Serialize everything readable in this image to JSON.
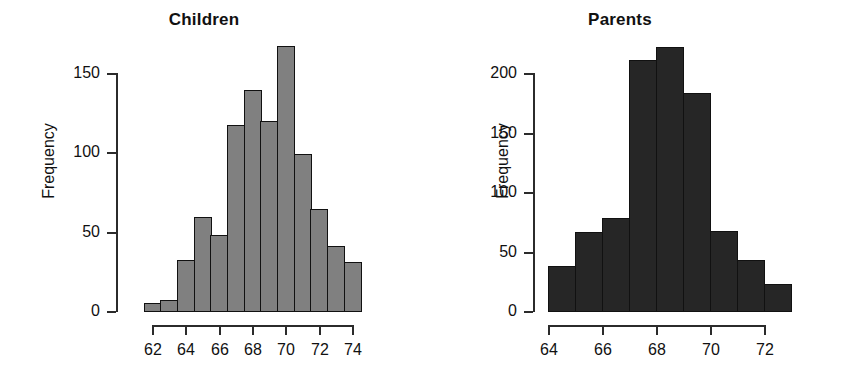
{
  "figure": {
    "panels": [
      {
        "id": "children",
        "title": "Children",
        "ylabel": "Frequency"
      },
      {
        "id": "parents",
        "title": "Parents",
        "ylabel": "Frequency"
      }
    ]
  },
  "chart_data": [
    {
      "type": "bar",
      "id": "children",
      "title": "Children",
      "xlabel": "",
      "ylabel": "Frequency",
      "bar_color": "#808080",
      "edge_color": "#111111",
      "grid": false,
      "legend": "none",
      "xlim": [
        61.5,
        74.0
      ],
      "ylim": [
        0,
        170
      ],
      "xticks": [
        62,
        64,
        66,
        68,
        70,
        72,
        74
      ],
      "xtick_labels": [
        "62",
        "64",
        "66",
        "68",
        "70",
        "72",
        "74"
      ],
      "yticks": [
        0,
        50,
        100,
        150
      ],
      "ytick_labels": [
        "0",
        "50",
        "100",
        "150"
      ],
      "bin_width": 1,
      "bin_edges": [
        61.5,
        62.5,
        63.5,
        64.5,
        65.5,
        66.5,
        67.5,
        68.5,
        69.5,
        70.5,
        71.5,
        72.5,
        73.5,
        74.5
      ],
      "categories": [
        "61.5-62.5",
        "62.5-63.5",
        "63.5-64.5",
        "64.5-65.5",
        "65.5-66.5",
        "66.5-67.5",
        "67.5-68.5",
        "68.5-69.5",
        "69.5-70.5",
        "70.5-71.5",
        "71.5-72.5",
        "72.5-73.5",
        "73.5-74.5"
      ],
      "values": [
        5,
        7,
        32,
        59,
        48,
        117,
        139,
        120,
        167,
        99,
        64,
        41,
        31
      ]
    },
    {
      "type": "bar",
      "id": "parents",
      "title": "Parents",
      "xlabel": "",
      "ylabel": "Frequency",
      "bar_color": "#262626",
      "edge_color": "#111111",
      "grid": false,
      "legend": "none",
      "xlim": [
        64.0,
        73.0
      ],
      "ylim": [
        0,
        225
      ],
      "xticks": [
        64,
        66,
        68,
        70,
        72
      ],
      "xtick_labels": [
        "64",
        "66",
        "68",
        "70",
        "72"
      ],
      "yticks": [
        0,
        50,
        100,
        150,
        200
      ],
      "ytick_labels": [
        "0",
        "50",
        "100",
        "150",
        "200"
      ],
      "bin_width": 1,
      "bin_edges": [
        64,
        65,
        66,
        67,
        68,
        69,
        70,
        71,
        72,
        73
      ],
      "categories": [
        "64-65",
        "65-66",
        "66-67",
        "67-68",
        "68-69",
        "69-70",
        "70-71",
        "71-72",
        "72-73"
      ],
      "values": [
        38,
        66,
        78,
        211,
        222,
        183,
        67,
        43,
        23
      ]
    }
  ]
}
